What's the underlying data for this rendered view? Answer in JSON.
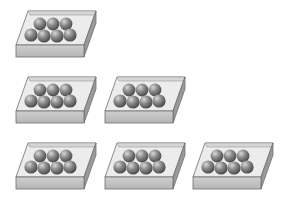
{
  "figure": {
    "balls_per_tray": 7,
    "back_row_balls": 3,
    "front_row_balls": 4,
    "colors": {
      "tray_top": "#e6e6e6",
      "tray_front": "#c4c4c4",
      "tray_side": "#9a9a9a",
      "tray_edge": "#6e6e6e",
      "ball_dark": "#4a4a4a",
      "ball_mid": "#8a8a8a",
      "ball_light": "#d8d8d8"
    }
  },
  "rows": [
    {
      "row": 1,
      "tray_count": 1,
      "trays": [
        {
          "x": 14,
          "y": 9
        }
      ]
    },
    {
      "row": 2,
      "tray_count": 2,
      "trays": [
        {
          "x": 14,
          "y": 75
        },
        {
          "x": 103,
          "y": 75
        }
      ]
    },
    {
      "row": 3,
      "tray_count": 3,
      "trays": [
        {
          "x": 14,
          "y": 141
        },
        {
          "x": 103,
          "y": 141
        },
        {
          "x": 191,
          "y": 141
        }
      ]
    }
  ]
}
